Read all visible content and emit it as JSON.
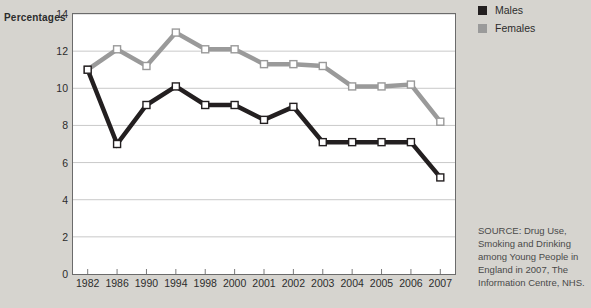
{
  "axis_title": "Percentages",
  "legend": {
    "items": [
      {
        "label": "Males",
        "color": "#231f20"
      },
      {
        "label": "Females",
        "color": "#9a9a9a"
      }
    ]
  },
  "source_note": "SOURCE: Drug Use, Smoking and Drinking among Young People in England in 2007, The Information Centre, NHS.",
  "chart_data": {
    "type": "line",
    "title": "",
    "xlabel": "",
    "ylabel": "Percentages",
    "categories": [
      "1982",
      "1986",
      "1990",
      "1994",
      "1998",
      "2000",
      "2001",
      "2002",
      "2003",
      "2004",
      "2005",
      "2006",
      "2007"
    ],
    "yticks": [
      0,
      2,
      4,
      6,
      8,
      10,
      12,
      14
    ],
    "ylim": [
      0,
      14
    ],
    "grid": "horizontal",
    "legend_position": "top-right",
    "series": [
      {
        "name": "Males",
        "color": "#231f20",
        "values": [
          11.0,
          7.0,
          9.1,
          10.1,
          9.1,
          9.1,
          8.3,
          9.0,
          7.1,
          7.1,
          7.1,
          7.1,
          5.2
        ]
      },
      {
        "name": "Females",
        "color": "#9a9a9a",
        "values": [
          11.0,
          12.1,
          11.2,
          13.0,
          12.1,
          12.1,
          11.3,
          11.3,
          11.2,
          10.1,
          10.1,
          10.2,
          8.2
        ]
      }
    ]
  }
}
